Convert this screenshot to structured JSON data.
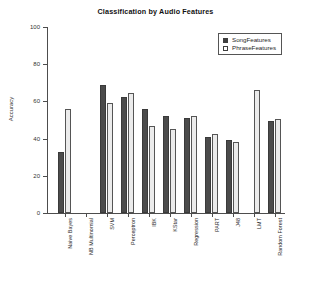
{
  "chart_data": {
    "type": "bar",
    "title": "Classification by Audio Features",
    "xlabel": "",
    "ylabel": "Accuracy",
    "ylim": [
      0,
      100
    ],
    "yticks": [
      0,
      20,
      40,
      60,
      80,
      100
    ],
    "grid": false,
    "legend_position": "top-right",
    "categories": [
      "Naive Bayes",
      "NB Multinomial",
      "SVM",
      "Perceptron",
      "IBK",
      "KStar",
      "Regression",
      "PART",
      "J48",
      "LMT",
      "Random Forest"
    ],
    "series": [
      {
        "name": "SongFeatures",
        "color": "#4b4b4b",
        "values": [
          33,
          0,
          69,
          62.5,
          56,
          52,
          51,
          41,
          39.5,
          0,
          49.5
        ]
      },
      {
        "name": "PhraseFeatures",
        "color": "#ebebeb",
        "values": [
          56,
          0,
          59,
          64.5,
          47,
          45,
          52,
          42.5,
          38,
          66,
          50.5
        ]
      }
    ]
  },
  "legend": {
    "entries": [
      {
        "label": "SongFeatures",
        "swatch": "filled-square"
      },
      {
        "label": "PhraseFeatures",
        "swatch": "open-square"
      }
    ]
  },
  "axis": {
    "y_title": "Accuracy",
    "y_tick_labels": [
      "100",
      "80",
      "60",
      "40",
      "20",
      "0"
    ]
  }
}
